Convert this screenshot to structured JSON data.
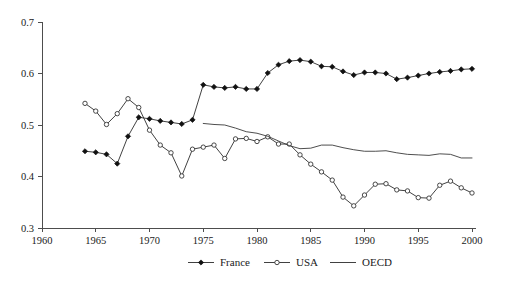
{
  "chart_data": {
    "type": "line",
    "title": "",
    "xlabel": "",
    "ylabel": "",
    "xlim": [
      1960,
      2000
    ],
    "ylim": [
      0.3,
      0.7
    ],
    "xticks": [
      1960,
      1965,
      1970,
      1975,
      1980,
      1985,
      1990,
      1995,
      2000
    ],
    "xtick_labels": [
      "1960",
      "1965",
      "1970",
      "1975",
      "1980",
      "1985",
      "1990",
      "1995",
      "2000"
    ],
    "yticks": [
      0.3,
      0.4,
      0.5,
      0.6,
      0.7
    ],
    "ytick_labels": [
      "0.3",
      "0.4",
      "0.5",
      "0.6",
      "0.7"
    ],
    "grid": false,
    "legend_position": "bottom",
    "series": [
      {
        "name": "France",
        "marker": "filled-diamond",
        "x": [
          1964,
          1965,
          1966,
          1967,
          1968,
          1969,
          1970,
          1971,
          1972,
          1973,
          1974,
          1975,
          1976,
          1977,
          1978,
          1979,
          1980,
          1981,
          1982,
          1983,
          1984,
          1985,
          1986,
          1987,
          1988,
          1989,
          1990,
          1991,
          1992,
          1993,
          1994,
          1995,
          1996,
          1997,
          1998,
          1999,
          2000
        ],
        "values": [
          0.449,
          0.447,
          0.443,
          0.425,
          0.478,
          0.515,
          0.512,
          0.508,
          0.505,
          0.502,
          0.51,
          0.578,
          0.574,
          0.572,
          0.574,
          0.57,
          0.57,
          0.601,
          0.617,
          0.624,
          0.626,
          0.623,
          0.614,
          0.613,
          0.604,
          0.597,
          0.602,
          0.602,
          0.6,
          0.589,
          0.592,
          0.596,
          0.6,
          0.603,
          0.605,
          0.608,
          0.609
        ]
      },
      {
        "name": "USA",
        "marker": "open-circle",
        "x": [
          1964,
          1965,
          1966,
          1967,
          1968,
          1969,
          1970,
          1971,
          1972,
          1973,
          1974,
          1975,
          1976,
          1977,
          1978,
          1979,
          1980,
          1981,
          1982,
          1983,
          1984,
          1985,
          1986,
          1987,
          1988,
          1989,
          1990,
          1991,
          1992,
          1993,
          1994,
          1995,
          1996,
          1997,
          1998,
          1999,
          2000
        ],
        "values": [
          0.542,
          0.527,
          0.501,
          0.522,
          0.551,
          0.534,
          0.49,
          0.461,
          0.446,
          0.401,
          0.453,
          0.457,
          0.461,
          0.435,
          0.473,
          0.474,
          0.468,
          0.477,
          0.463,
          0.463,
          0.442,
          0.424,
          0.409,
          0.393,
          0.36,
          0.343,
          0.364,
          0.385,
          0.386,
          0.374,
          0.372,
          0.359,
          0.358,
          0.383,
          0.391,
          0.378,
          0.368
        ]
      },
      {
        "name": "OECD",
        "marker": "none",
        "x": [
          1975,
          1976,
          1977,
          1978,
          1979,
          1980,
          1981,
          1982,
          1983,
          1984,
          1985,
          1986,
          1987,
          1988,
          1989,
          1990,
          1991,
          1992,
          1993,
          1994,
          1995,
          1996,
          1997,
          1998,
          1999,
          2000
        ],
        "values": [
          0.503,
          0.501,
          0.5,
          0.494,
          0.487,
          0.484,
          0.478,
          0.469,
          0.46,
          0.454,
          0.455,
          0.461,
          0.461,
          0.456,
          0.452,
          0.449,
          0.449,
          0.45,
          0.446,
          0.443,
          0.442,
          0.441,
          0.444,
          0.443,
          0.436,
          0.436
        ]
      }
    ],
    "legend": [
      {
        "label": "France",
        "marker": "filled-diamond"
      },
      {
        "label": "USA",
        "marker": "open-circle"
      },
      {
        "label": "OECD",
        "marker": "none"
      }
    ],
    "colors": {
      "france": "#111111",
      "usa": "#2b2b2b",
      "oecd": "#3a3a3a",
      "axis": "#4d4d4d",
      "background": "#ffffff"
    }
  }
}
